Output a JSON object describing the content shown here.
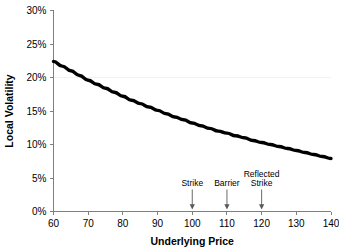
{
  "chart_data": {
    "type": "line",
    "title": "",
    "xlabel": "Underlying Price",
    "ylabel": "Local Volatility",
    "xlim": [
      60,
      140
    ],
    "ylim": [
      0,
      30
    ],
    "xticks": [
      60,
      70,
      80,
      90,
      100,
      110,
      120,
      130,
      140
    ],
    "xtick_labels": [
      "60",
      "70",
      "80",
      "90",
      "100",
      "110",
      "120",
      "130",
      "140"
    ],
    "yticks": [
      0,
      5,
      10,
      15,
      20,
      25,
      30
    ],
    "ytick_labels": [
      "0%",
      "5%",
      "10%",
      "15%",
      "20%",
      "25%",
      "30%"
    ],
    "grid": "horizontal-single-at-20",
    "legend": "none",
    "series": [
      {
        "name": "Local Volatility",
        "x": [
          60,
          62.5,
          65,
          67.5,
          70,
          72.5,
          75,
          77.5,
          80,
          82.5,
          85,
          87.5,
          90,
          92.5,
          95,
          97.5,
          100,
          102.5,
          105,
          107.5,
          110,
          112.5,
          115,
          117.5,
          120,
          122.5,
          125,
          127.5,
          130,
          132.5,
          135,
          137.5,
          140
        ],
        "values": [
          22.4,
          21.7,
          21.0,
          20.3,
          19.6,
          19.0,
          18.4,
          17.8,
          17.2,
          16.6,
          16.1,
          15.6,
          15.1,
          14.6,
          14.1,
          13.7,
          13.2,
          12.8,
          12.4,
          12.0,
          11.7,
          11.3,
          11.0,
          10.6,
          10.3,
          10.0,
          9.7,
          9.4,
          9.1,
          8.8,
          8.5,
          8.2,
          7.9
        ]
      }
    ],
    "annotations": [
      {
        "label": "Strike",
        "x": 100,
        "label_lines": [
          "Strike"
        ]
      },
      {
        "label": "Barrier",
        "x": 110,
        "label_lines": [
          "Barrier"
        ]
      },
      {
        "label": "Reflected Strike",
        "x": 120,
        "label_lines": [
          "Reflected",
          "Strike"
        ]
      }
    ],
    "colors": {
      "curve": "#000000",
      "axis": "#808080",
      "gridline": "#f2f2f2",
      "annotation": "#595959",
      "background": "#ffffff"
    }
  }
}
